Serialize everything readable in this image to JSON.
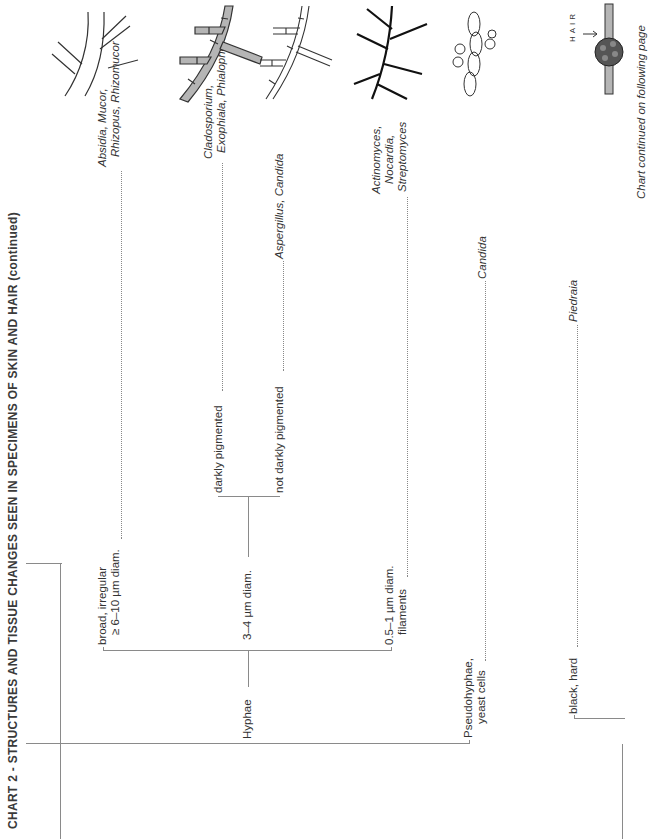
{
  "header": {
    "title": "CHART 2 - STRUCTURES AND TISSUE CHANGES SEEN IN SPECIMENS OF SKIN AND HAIR (continued)"
  },
  "tree": {
    "root_branches": [
      {
        "label": "Hyphae",
        "children": [
          {
            "label_line1": "broad, irregular",
            "label_line2": "≥ 6–10 µm diam.",
            "result_line1": "Absidia, Mucor,",
            "result_line2": "Rhizopus, Rhizomucor",
            "illustration": "broad-aseptate-hyphae-illustration"
          },
          {
            "label": "3–4 µm diam.",
            "children": [
              {
                "label": "darkly pigmented",
                "result_line1": "Cladosporium,",
                "result_line2": "Exophiala, Phialophora",
                "illustration": "dematiaceous-septate-hyphae-illustration"
              },
              {
                "label": "not darkly pigmented",
                "result": "Aspergillus, Candida",
                "illustration": "hyaline-septate-hyphae-illustration"
              }
            ]
          },
          {
            "label_line1": "0.5–1 µm diam.",
            "label_line2": "filaments",
            "result_line1": "Actinomyces,",
            "result_line2": "Nocardia,",
            "result_line3": "Streptomyces",
            "illustration": "thin-branching-filaments-illustration"
          }
        ]
      },
      {
        "label_line1": "Pseudohyphae,",
        "label_line2": "yeast cells",
        "result": "Candida",
        "illustration": "pseudohyphae-yeast-illustration"
      }
    ],
    "hair_nodule": {
      "label": "black, hard",
      "result": "Piedraia",
      "illustration_label": "HAIR",
      "illustration": "black-piedra-nodule-on-hair-illustration"
    }
  },
  "footer": {
    "continued": "Chart continued on following page"
  }
}
